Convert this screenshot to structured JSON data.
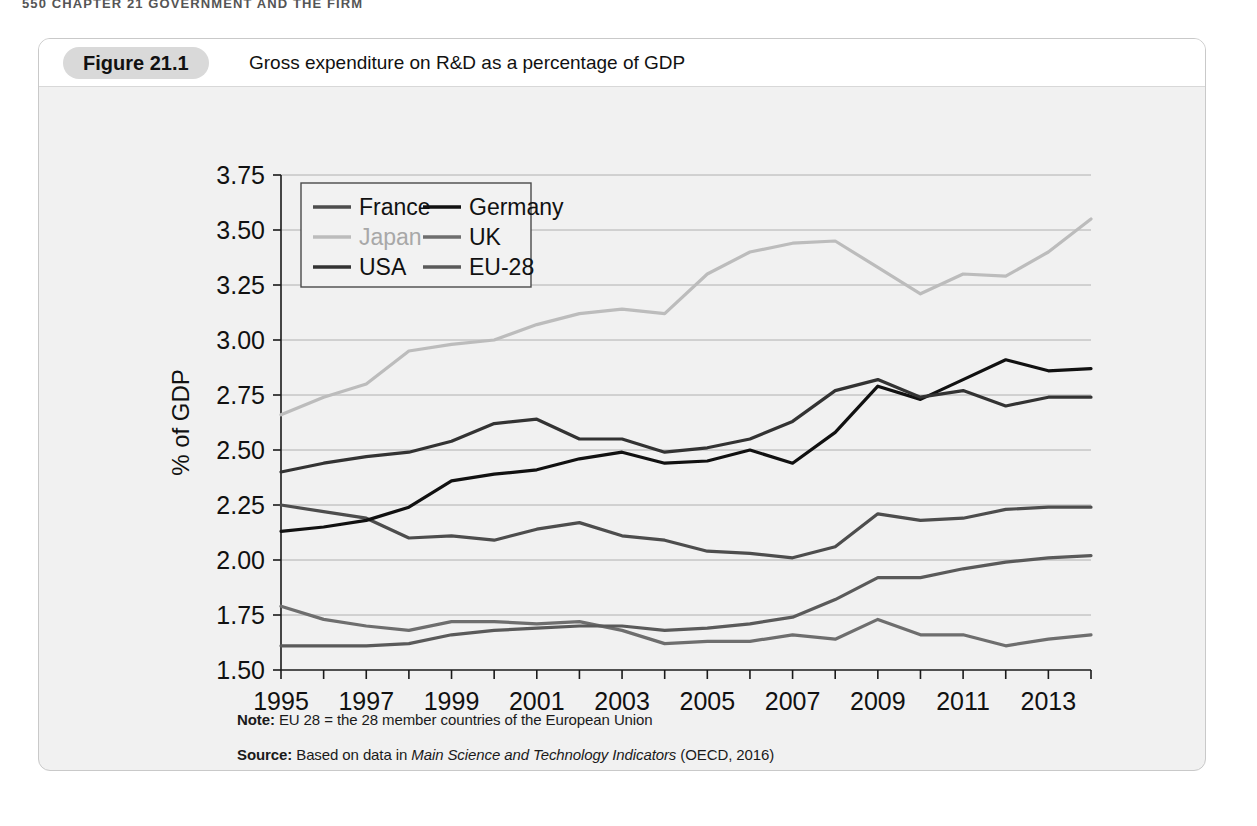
{
  "page_header": "550  CHAPTER 21  GOVERNMENT AND THE FIRM",
  "figure": {
    "tag": "Figure 21.1",
    "caption": "Gross expenditure on R&D as a percentage of GDP",
    "note_label": "Note:",
    "note_body": " EU 28 = the 28 member countries of the European Union",
    "source_label": "Source:",
    "source_body_1": " Based on data in ",
    "source_italic": "Main Science and Technology Indicators",
    "source_body_2": " (OECD, 2016)"
  },
  "colors": {
    "france": "#4d4d4d",
    "germany": "#111111",
    "japan": "#bcbcbc",
    "uk": "#6e6e6e",
    "usa": "#333333",
    "eu28": "#5a5a5a",
    "grid": "#b0b0b0",
    "axis": "#1a1a1a",
    "plot_bg": "#ffffff",
    "figure_bg": "#f1f1f1",
    "tag_bg": "#d9d9d9"
  },
  "chart_data": {
    "type": "line",
    "title": "Gross expenditure on R&D as a percentage of GDP",
    "xlabel": "",
    "ylabel": "% of GDP",
    "ylim": [
      1.5,
      3.75
    ],
    "ytick_values": [
      1.5,
      1.75,
      2.0,
      2.25,
      2.5,
      2.75,
      3.0,
      3.25,
      3.5,
      3.75
    ],
    "ytick_labels": [
      "1.50",
      "1.75",
      "2.00",
      "2.25",
      "2.50",
      "2.75",
      "3.00",
      "3.25",
      "3.50",
      "3.75"
    ],
    "grid": true,
    "legend_position": "upper-left",
    "xlim": [
      1995,
      2014
    ],
    "x": [
      1995,
      1996,
      1997,
      1998,
      1999,
      2000,
      2001,
      2002,
      2003,
      2004,
      2005,
      2006,
      2007,
      2008,
      2009,
      2010,
      2011,
      2012,
      2013,
      2014
    ],
    "xtick_values": [
      1995,
      1996,
      1997,
      1998,
      1999,
      2000,
      2001,
      2002,
      2003,
      2004,
      2005,
      2006,
      2007,
      2008,
      2009,
      2010,
      2011,
      2012,
      2013,
      2014
    ],
    "xtick_labels_shown": [
      "1995",
      "",
      "1997",
      "",
      "1999",
      "",
      "2001",
      "",
      "2003",
      "",
      "2005",
      "",
      "2007",
      "",
      "2009",
      "",
      "2011",
      "",
      "2013",
      ""
    ],
    "series": [
      {
        "name": "France",
        "color": "#4d4d4d",
        "values": [
          2.25,
          2.22,
          2.19,
          2.1,
          2.11,
          2.09,
          2.14,
          2.17,
          2.11,
          2.09,
          2.04,
          2.03,
          2.01,
          2.06,
          2.21,
          2.18,
          2.19,
          2.23,
          2.24,
          2.24
        ]
      },
      {
        "name": "Germany",
        "color": "#111111",
        "values": [
          2.13,
          2.15,
          2.18,
          2.24,
          2.36,
          2.39,
          2.41,
          2.46,
          2.49,
          2.44,
          2.45,
          2.5,
          2.44,
          2.58,
          2.79,
          2.73,
          2.82,
          2.91,
          2.86,
          2.87
        ]
      },
      {
        "name": "Japan",
        "color": "#bcbcbc",
        "values": [
          2.66,
          2.74,
          2.8,
          2.95,
          2.98,
          3.0,
          3.07,
          3.12,
          3.14,
          3.12,
          3.3,
          3.4,
          3.44,
          3.45,
          3.33,
          3.21,
          3.3,
          3.29,
          3.4,
          3.55
        ]
      },
      {
        "name": "UK",
        "color": "#6e6e6e",
        "values": [
          1.79,
          1.73,
          1.7,
          1.68,
          1.72,
          1.72,
          1.71,
          1.72,
          1.68,
          1.62,
          1.63,
          1.63,
          1.66,
          1.64,
          1.73,
          1.66,
          1.66,
          1.61,
          1.64,
          1.66
        ]
      },
      {
        "name": "USA",
        "color": "#333333",
        "values": [
          2.4,
          2.44,
          2.47,
          2.49,
          2.54,
          2.62,
          2.64,
          2.55,
          2.55,
          2.49,
          2.51,
          2.55,
          2.63,
          2.77,
          2.82,
          2.74,
          2.77,
          2.7,
          2.74,
          2.74
        ]
      },
      {
        "name": "EU-28",
        "color": "#5a5a5a",
        "values": [
          1.61,
          1.61,
          1.61,
          1.62,
          1.66,
          1.68,
          1.69,
          1.7,
          1.7,
          1.68,
          1.69,
          1.71,
          1.74,
          1.82,
          1.92,
          1.92,
          1.96,
          1.99,
          2.01,
          2.02
        ]
      }
    ]
  },
  "legend": {
    "entries": [
      {
        "label": "France",
        "color": "#4d4d4d"
      },
      {
        "label": "Germany",
        "color": "#111111"
      },
      {
        "label": "Japan",
        "color": "#bcbcbc"
      },
      {
        "label": "UK",
        "color": "#6e6e6e"
      },
      {
        "label": "USA",
        "color": "#333333"
      },
      {
        "label": "EU-28",
        "color": "#5a5a5a"
      }
    ]
  }
}
